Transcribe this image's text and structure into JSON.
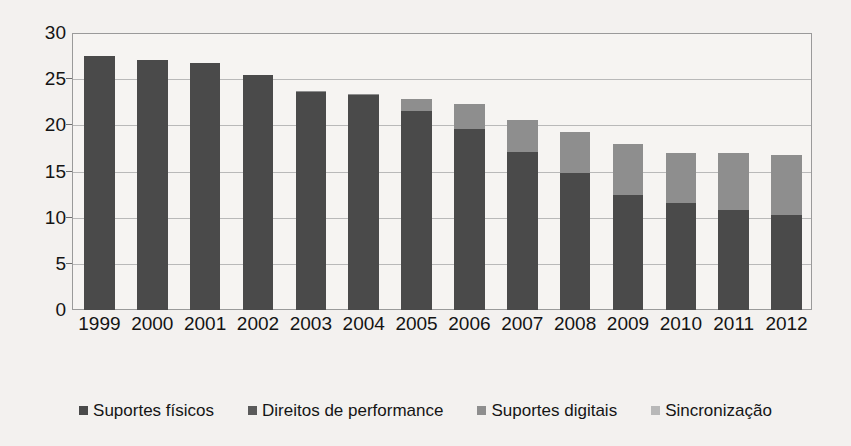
{
  "chart_data": {
    "type": "bar",
    "subtype": "stacked-bar",
    "title": "",
    "xlabel": "",
    "ylabel": "",
    "ylim": [
      0,
      30
    ],
    "yticks": [
      0,
      5,
      10,
      15,
      20,
      25,
      30
    ],
    "ytick_labels": [
      "0",
      "5",
      "10",
      "15",
      "20",
      "25",
      "30"
    ],
    "grid": true,
    "legend_position": "bottom",
    "categories": [
      "1999",
      "2000",
      "2001",
      "2002",
      "2003",
      "2004",
      "2005",
      "2006",
      "2007",
      "2008",
      "2009",
      "2010",
      "2011",
      "2012"
    ],
    "series": [
      {
        "name": "Suportes físicos",
        "color": "#4a4a4a",
        "values": [
          27.5,
          27.1,
          26.8,
          25.4,
          23.6,
          23.3,
          21.5,
          19.6,
          17.1,
          14.8,
          12.5,
          11.6,
          10.8,
          10.3
        ]
      },
      {
        "name": "Direitos de performance",
        "color": "#5e5e5e",
        "values": [
          0.0,
          0.0,
          0.0,
          0.0,
          0.0,
          0.0,
          0.0,
          0.0,
          0.0,
          0.0,
          0.0,
          0.0,
          0.0,
          0.0
        ]
      },
      {
        "name": "Suportes digitais",
        "color": "#8e8e8e",
        "values": [
          0.0,
          0.0,
          0.0,
          0.0,
          0.1,
          0.1,
          1.4,
          2.7,
          3.5,
          4.5,
          5.5,
          5.4,
          6.2,
          6.5
        ]
      },
      {
        "name": "Sincronização",
        "color": "#b4b4b4",
        "values": [
          0.0,
          0.0,
          0.0,
          0.0,
          0.0,
          0.0,
          0.0,
          0.0,
          0.0,
          0.0,
          0.0,
          0.0,
          0.0,
          0.0
        ]
      }
    ],
    "totals": [
      27.5,
      27.1,
      26.8,
      25.4,
      23.7,
      23.4,
      22.9,
      22.3,
      20.6,
      19.3,
      18.0,
      17.0,
      17.0,
      16.8
    ]
  },
  "legend": {
    "items": [
      {
        "label": "Suportes físicos",
        "color": "#4a4a4a"
      },
      {
        "label": "Direitos de performance",
        "color": "#5a5a5a"
      },
      {
        "label": "Suportes digitais",
        "color": "#8e8e8e"
      },
      {
        "label": "Sincronização",
        "color": "#b8b8b8"
      }
    ]
  },
  "colors": {
    "background": "#f3f1ef",
    "plot_background": "#f6f4f2",
    "plot_border": "#9a9a9a",
    "gridline": "#b9b9b9",
    "text": "#141414"
  }
}
